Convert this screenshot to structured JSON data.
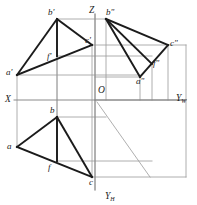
{
  "figure": {
    "type": "descriptive-geometry-projection",
    "colors": {
      "object_line": "#1b1b1b",
      "projection_line": "#9a9a9a",
      "axis_line": "#8a8a8a",
      "background": "#ffffff",
      "label_text": "#1b1b1b"
    },
    "axes": [
      {
        "id": "x-axis",
        "label": "X",
        "label_x": 5,
        "label_y": 95,
        "x1": 14,
        "y1": 100,
        "x2": 186,
        "y2": 100
      },
      {
        "id": "z-axis",
        "label": "Z",
        "label_x": 89,
        "label_y": 6,
        "x1": 95,
        "y1": 14,
        "x2": 95,
        "y2": 100
      },
      {
        "id": "yw-axis",
        "label": "Y",
        "sub": "W",
        "label_x": 176,
        "label_y": 94,
        "x1": 95,
        "y1": 100,
        "x2": 186,
        "y2": 100
      },
      {
        "id": "yh-axis",
        "label": "Y",
        "sub": "H",
        "label_x": 105,
        "label_y": 192,
        "x1": 95,
        "y1": 100,
        "x2": 95,
        "y2": 190
      },
      {
        "id": "origin",
        "label": "O",
        "label_x": 98,
        "label_y": 86
      }
    ],
    "bisector": {
      "id": "bisector-line",
      "x1": 97,
      "y1": 102,
      "x2": 150,
      "y2": 177
    },
    "projections": [
      {
        "id": "v-projection",
        "name": "frontal-projection",
        "points": [
          {
            "id": "a-prime",
            "label": "a'",
            "x": 17,
            "y": 75,
            "label_x": 6,
            "label_y": 68
          },
          {
            "id": "b-prime",
            "label": "b'",
            "x": 57,
            "y": 19,
            "label_x": 48,
            "label_y": 8
          },
          {
            "id": "c-prime",
            "label": "c'",
            "x": 92,
            "y": 45,
            "label_x": 85,
            "label_y": 36
          },
          {
            "id": "f-prime",
            "label": "f'",
            "x": 57,
            "y": 56,
            "label_x": 47,
            "label_y": 52
          }
        ],
        "edges": [
          {
            "from": "a-prime",
            "to": "b-prime"
          },
          {
            "from": "b-prime",
            "to": "c-prime"
          },
          {
            "from": "a-prime",
            "to": "c-prime"
          },
          {
            "from": "b-prime",
            "to": "f-prime"
          }
        ]
      },
      {
        "id": "w-projection",
        "name": "profile-projection",
        "points": [
          {
            "id": "a-double-prime",
            "label": "a\"",
            "x": 140,
            "y": 77,
            "label_x": 136,
            "label_y": 77
          },
          {
            "id": "b-double-prime",
            "label": "b\"",
            "x": 106,
            "y": 19,
            "label_x": 106,
            "label_y": 8
          },
          {
            "id": "c-double-prime",
            "label": "c\"",
            "x": 168,
            "y": 45,
            "label_x": 170,
            "label_y": 39
          },
          {
            "id": "f-double-prime",
            "label": "f\"",
            "x": 152,
            "y": 64,
            "label_x": 153,
            "label_y": 59
          }
        ],
        "edges": [
          {
            "from": "b-double-prime",
            "to": "a-double-prime"
          },
          {
            "from": "b-double-prime",
            "to": "c-double-prime"
          },
          {
            "from": "a-double-prime",
            "to": "c-double-prime"
          },
          {
            "from": "b-double-prime",
            "to": "f-double-prime"
          }
        ]
      },
      {
        "id": "h-projection",
        "name": "horizontal-projection",
        "points": [
          {
            "id": "a-plain",
            "label": "a",
            "x": 17,
            "y": 147,
            "label_x": 7,
            "label_y": 142
          },
          {
            "id": "b-plain",
            "label": "b",
            "x": 57,
            "y": 117,
            "label_x": 50,
            "label_y": 106
          },
          {
            "id": "c-plain",
            "label": "c",
            "x": 92,
            "y": 177,
            "label_x": 89,
            "label_y": 178
          },
          {
            "id": "f-plain",
            "label": "f",
            "x": 57,
            "y": 161,
            "label_x": 48,
            "label_y": 163
          }
        ],
        "edges": [
          {
            "from": "a-plain",
            "to": "b-plain"
          },
          {
            "from": "b-plain",
            "to": "c-plain"
          },
          {
            "from": "a-plain",
            "to": "c-plain"
          },
          {
            "from": "b-plain",
            "to": "f-plain"
          }
        ]
      }
    ],
    "construction_lines": {
      "vertical": [
        {
          "id": "vline-a",
          "x": 17,
          "y1": 75,
          "y2": 147
        },
        {
          "id": "vline-b",
          "x": 57,
          "y1": 19,
          "y2": 161
        },
        {
          "id": "vline-f",
          "x": 57,
          "y1": 56,
          "y2": 161
        },
        {
          "id": "vline-c",
          "x": 92,
          "y1": 45,
          "y2": 177
        },
        {
          "id": "vline-z",
          "x": 95,
          "y1": 14,
          "y2": 190
        },
        {
          "id": "vline-w-b",
          "x": 106,
          "y1": 19,
          "y2": 100
        },
        {
          "id": "vline-w-a",
          "x": 140,
          "y1": 77,
          "y2": 100
        },
        {
          "id": "vline-w-f",
          "x": 152,
          "y1": 64,
          "y2": 100
        },
        {
          "id": "vline-w-c",
          "x": 168,
          "y1": 45,
          "y2": 100
        },
        {
          "id": "vline-frame-right",
          "x": 186,
          "y1": 45,
          "y2": 177
        }
      ],
      "horizontal": [
        {
          "id": "hline-b",
          "y": 19,
          "x1": 57,
          "x2": 106
        },
        {
          "id": "hline-c",
          "y": 45,
          "x1": 92,
          "x2": 186
        },
        {
          "id": "hline-f",
          "y": 56,
          "x1": 57,
          "x2": 152
        },
        {
          "id": "hline-a",
          "y": 75,
          "x1": 17,
          "x2": 140
        },
        {
          "id": "hline-a2",
          "y": 77,
          "x1": 95,
          "x2": 140
        },
        {
          "id": "hline-b-h",
          "y": 117,
          "x1": 57,
          "x2": 106
        },
        {
          "id": "hline-f-h",
          "y": 161,
          "x1": 57,
          "x2": 152
        },
        {
          "id": "hline-c-h",
          "y": 177,
          "x1": 92,
          "x2": 186
        }
      ]
    }
  }
}
